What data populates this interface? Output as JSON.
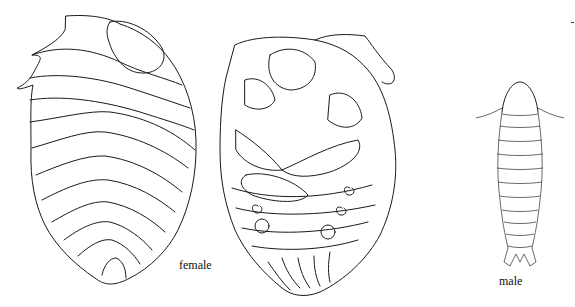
{
  "figure": {
    "labels": {
      "female": "female",
      "male": "male"
    },
    "specimens": [
      {
        "id": "female-dorsal",
        "sex": "female",
        "view": "dorsal"
      },
      {
        "id": "female-ventral",
        "sex": "female",
        "view": "ventral"
      },
      {
        "id": "male",
        "sex": "male",
        "view": "dorsal"
      }
    ],
    "line_color": "#1a1a1a",
    "background": "#ffffff"
  }
}
